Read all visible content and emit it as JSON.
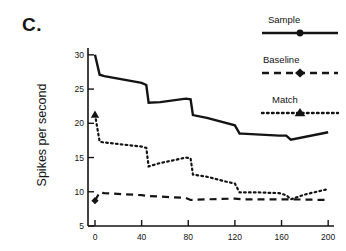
{
  "figure": {
    "panel_label": "C.",
    "background": "#ffffff",
    "ink_color": "#141414"
  },
  "legend": {
    "position": "top-right",
    "entries": [
      {
        "label": "Sample",
        "style": "solid",
        "marker": "circle",
        "color": "#141414"
      },
      {
        "label": "Baseline",
        "style": "dashed",
        "marker": "diamond",
        "color": "#141414"
      },
      {
        "label": "Match",
        "style": "dotted",
        "marker": "triangle",
        "color": "#141414"
      }
    ]
  },
  "axes": {
    "ylabel": "Spikes per second",
    "xlabel": "",
    "yticks": [
      "5",
      "10",
      "15",
      "20",
      "25",
      "30"
    ],
    "xticks": [
      "0",
      "40",
      "80",
      "120",
      "160",
      "200"
    ],
    "ylim": [
      5,
      31
    ],
    "xlim": [
      -6,
      205
    ],
    "grid": false
  },
  "chart_data": {
    "type": "line",
    "title": "",
    "xlabel": "",
    "ylabel": "Spikes per second",
    "xlim": [
      -6,
      205
    ],
    "ylim": [
      5,
      31
    ],
    "xticks": [
      0,
      40,
      80,
      120,
      160,
      200
    ],
    "yticks": [
      5,
      10,
      15,
      20,
      25,
      30
    ],
    "grid": false,
    "legend_position": "top-right",
    "series": [
      {
        "name": "Sample",
        "style": "solid",
        "marker": "circle",
        "color": "#141414",
        "x": [
          0,
          4,
          8,
          40,
          44,
          46,
          56,
          78,
          82,
          84,
          96,
          120,
          124,
          126,
          158,
          164,
          168,
          200
        ],
        "y": [
          30.0,
          27.1,
          26.9,
          25.9,
          25.6,
          23.0,
          23.1,
          23.6,
          23.5,
          21.2,
          20.8,
          19.7,
          18.5,
          18.5,
          18.2,
          18.2,
          17.6,
          18.7
        ]
      },
      {
        "name": "Baseline",
        "style": "dashed",
        "marker": "diamond",
        "color": "#141414",
        "x": [
          0,
          4,
          8,
          40,
          44,
          56,
          78,
          82,
          96,
          120,
          126,
          158,
          164,
          168,
          200
        ],
        "y": [
          8.7,
          9.9,
          9.8,
          9.5,
          9.4,
          9.3,
          9.1,
          8.8,
          8.9,
          9.0,
          8.9,
          8.9,
          8.9,
          8.9,
          8.8
        ]
      },
      {
        "name": "Match",
        "style": "dotted",
        "marker": "triangle",
        "color": "#141414",
        "x": [
          0,
          4,
          8,
          40,
          44,
          46,
          56,
          70,
          78,
          82,
          84,
          96,
          112,
          120,
          124,
          126,
          140,
          158,
          164,
          168,
          180,
          200
        ],
        "y": [
          21.3,
          17.3,
          17.2,
          16.6,
          16.4,
          13.7,
          14.2,
          14.7,
          15.0,
          14.9,
          12.5,
          12.2,
          11.5,
          11.2,
          9.9,
          9.9,
          9.9,
          9.8,
          9.5,
          8.9,
          9.6,
          10.4
        ]
      }
    ]
  }
}
